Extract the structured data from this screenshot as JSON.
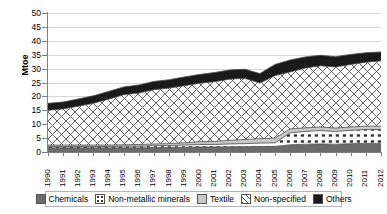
{
  "chart_data": {
    "type": "area",
    "title": "",
    "xlabel": "",
    "ylabel": "Mtoe",
    "ylim": [
      0,
      50
    ],
    "ytick_step": 5,
    "yticks": [
      "0",
      "5",
      "10",
      "15",
      "20",
      "25",
      "30",
      "35",
      "40",
      "45",
      "50"
    ],
    "grid": true,
    "stacked": true,
    "legend_position": "bottom",
    "categories": [
      "1990",
      "1991",
      "1992",
      "1993",
      "1994",
      "1995",
      "1996",
      "1997",
      "1998",
      "1999",
      "2000",
      "2001",
      "2002",
      "2003",
      "2004",
      "2005",
      "2006",
      "2007",
      "2008",
      "2009",
      "2010",
      "2011",
      "2012"
    ],
    "series": [
      {
        "name": "Chemicals",
        "pattern": "solid-dark-gray",
        "color": "#6b6b6b",
        "values": [
          1.5,
          1.5,
          1.5,
          1.5,
          1.5,
          1.5,
          1.5,
          1.6,
          1.6,
          1.7,
          1.8,
          1.8,
          1.9,
          1.9,
          2.0,
          2.0,
          2.6,
          2.8,
          2.9,
          2.8,
          3.0,
          3.1,
          3.1
        ]
      },
      {
        "name": "Non-metallic minerals",
        "pattern": "white-with-dots",
        "color": "#ffffff",
        "values": [
          0.5,
          0.5,
          0.5,
          0.5,
          0.5,
          0.6,
          0.6,
          0.7,
          0.7,
          0.8,
          0.9,
          0.9,
          1.0,
          1.1,
          1.2,
          1.3,
          4.3,
          4.6,
          4.8,
          4.6,
          4.8,
          5.0,
          5.0
        ]
      },
      {
        "name": "Textile",
        "pattern": "light-gray",
        "color": "#c8c8c8",
        "values": [
          0.5,
          0.5,
          0.5,
          0.5,
          0.5,
          0.5,
          0.6,
          0.6,
          0.7,
          0.8,
          1.0,
          1.1,
          1.3,
          1.5,
          1.6,
          1.7,
          1.4,
          1.3,
          1.3,
          1.2,
          1.2,
          1.2,
          1.2
        ]
      },
      {
        "name": "Non-specified",
        "pattern": "crosshatch",
        "color": "#ffffff",
        "values": [
          12.5,
          13.0,
          14.0,
          15.0,
          16.5,
          18.0,
          18.5,
          19.5,
          20.0,
          20.5,
          21.0,
          21.5,
          22.0,
          22.0,
          20.0,
          22.5,
          20.5,
          21.5,
          22.0,
          22.0,
          22.5,
          23.0,
          23.5
        ]
      },
      {
        "name": "Others",
        "pattern": "solid-black",
        "color": "#1a1a1a",
        "values": [
          2.5,
          2.5,
          2.6,
          2.7,
          2.8,
          2.8,
          2.9,
          3.0,
          3.0,
          3.2,
          3.2,
          3.3,
          3.3,
          3.3,
          3.4,
          4.0,
          4.3,
          4.0,
          3.8,
          3.7,
          3.6,
          3.4,
          3.2
        ]
      }
    ],
    "totals": [
      17.5,
      18.0,
      19.1,
      20.2,
      21.8,
      23.4,
      24.1,
      25.4,
      26.0,
      27.0,
      27.9,
      28.6,
      29.5,
      29.8,
      28.2,
      31.5,
      33.1,
      34.2,
      34.8,
      34.3,
      35.1,
      35.7,
      36.0
    ]
  },
  "legend": {
    "items": [
      {
        "label": "Chemicals"
      },
      {
        "label": "Non-metallic minerals"
      },
      {
        "label": "Textile"
      },
      {
        "label": "Non-specified"
      },
      {
        "label": "Others"
      }
    ]
  }
}
